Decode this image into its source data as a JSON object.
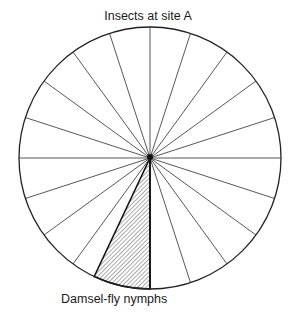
{
  "title": "Insects at site A",
  "chart_data": {
    "type": "pie",
    "title": "Insects at site A",
    "grid_divisions": 20,
    "grid_division_percent": 5,
    "highlighted_slice": {
      "label": "Damsel-fly nymphs",
      "percent": 7,
      "fill": "hatched"
    },
    "slices": [
      {
        "label": "Damsel-fly nymphs",
        "percent": 7,
        "hatched": true
      },
      {
        "label": "",
        "percent": 93,
        "hatched": false
      }
    ]
  },
  "labels": {
    "highlighted": "Damsel-fly nymphs"
  },
  "colors": {
    "line": "#222222",
    "hatch": "#555555",
    "background": "#ffffff"
  }
}
